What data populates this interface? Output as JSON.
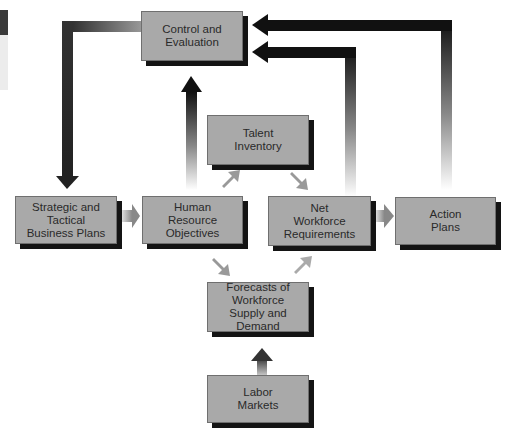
{
  "diagram": {
    "type": "flowchart",
    "nodes": {
      "control": "Control and\nEvaluation",
      "strategic": "Strategic and\nTactical\nBusiness Plans",
      "hr_objectives": "Human\nResource\nObjectives",
      "talent": "Talent\nInventory",
      "net_workforce": "Net\nWorkforce\nRequirements",
      "action": "Action\nPlans",
      "forecasts": "Forecasts of\nWorkforce\nSupply and Demand",
      "labor": "Labor\nMarkets"
    },
    "edges": [
      {
        "from": "Control and Evaluation",
        "to": "Strategic and Tactical Business Plans"
      },
      {
        "from": "Strategic and Tactical Business Plans",
        "to": "Human Resource Objectives"
      },
      {
        "from": "Human Resource Objectives",
        "to": "Control and Evaluation"
      },
      {
        "from": "Human Resource Objectives",
        "to": "Talent Inventory"
      },
      {
        "from": "Human Resource Objectives",
        "to": "Forecasts of Workforce Supply and Demand"
      },
      {
        "from": "Talent Inventory",
        "to": "Net Workforce Requirements"
      },
      {
        "from": "Forecasts of Workforce Supply and Demand",
        "to": "Net Workforce Requirements"
      },
      {
        "from": "Net Workforce Requirements",
        "to": "Action Plans"
      },
      {
        "from": "Net Workforce Requirements",
        "to": "Control and Evaluation"
      },
      {
        "from": "Action Plans",
        "to": "Control and Evaluation"
      },
      {
        "from": "Labor Markets",
        "to": "Forecasts of Workforce Supply and Demand"
      }
    ],
    "colors": {
      "box_fill": "#a9a9a9",
      "box_shadow": "#141414",
      "arrow_dark": "#111111"
    }
  }
}
